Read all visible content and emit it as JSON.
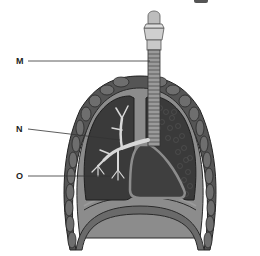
{
  "diagram": {
    "labels": [
      {
        "id": "M",
        "text": "M",
        "x": 16,
        "y": 57
      },
      {
        "id": "N",
        "text": "N",
        "x": 16,
        "y": 125
      },
      {
        "id": "O",
        "text": "O",
        "x": 16,
        "y": 172
      }
    ],
    "colors": {
      "lung_tissue": "#3a3a3a",
      "pleura": "#8c8c8c",
      "outline": "#2a2a2a",
      "airway": "#d8d8d8",
      "rib": "#6e6e6e",
      "background": "#ffffff"
    }
  }
}
